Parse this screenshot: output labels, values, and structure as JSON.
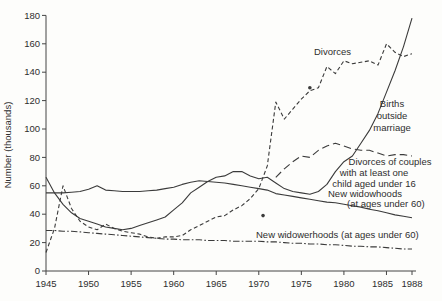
{
  "chart_data": {
    "type": "line",
    "title": "",
    "xlabel": "",
    "ylabel": "Number (thousands)",
    "xlim": [
      1945,
      1988
    ],
    "ylim": [
      0,
      180
    ],
    "grid": false,
    "legend_position": "inline-annotations",
    "x_ticks": [
      1945,
      1950,
      1955,
      1960,
      1965,
      1970,
      1975,
      1980,
      1985,
      1988
    ],
    "y_ticks": [
      0,
      20,
      40,
      60,
      80,
      100,
      120,
      140,
      160,
      180
    ],
    "x": [
      1945,
      1946,
      1947,
      1948,
      1949,
      1950,
      1951,
      1952,
      1953,
      1954,
      1955,
      1956,
      1957,
      1958,
      1959,
      1960,
      1961,
      1962,
      1963,
      1964,
      1965,
      1966,
      1967,
      1968,
      1969,
      1970,
      1971,
      1972,
      1973,
      1974,
      1975,
      1976,
      1977,
      1978,
      1979,
      1980,
      1981,
      1982,
      1983,
      1984,
      1985,
      1986,
      1987,
      1988
    ],
    "series": [
      {
        "name": "Divorces",
        "style": "short-dash",
        "values": [
          13,
          30,
          60,
          44,
          35,
          31,
          29,
          33,
          30,
          28,
          27,
          26,
          24,
          23,
          24,
          24,
          25,
          29,
          32,
          35,
          38,
          39,
          43,
          46,
          51,
          58,
          74,
          119,
          107,
          114,
          121,
          127,
          129,
          144,
          139,
          148,
          146,
          147,
          148,
          145,
          160,
          154,
          151,
          153
        ]
      },
      {
        "name": "Births outside marriage",
        "style": "solid",
        "values": [
          66,
          55,
          47,
          41,
          37,
          35,
          33,
          31,
          30,
          29,
          30,
          32,
          34,
          36,
          38,
          43,
          48,
          55,
          59,
          63,
          66,
          67,
          70,
          70,
          67,
          65,
          66,
          62,
          58,
          56,
          55,
          54,
          56,
          61,
          70,
          77,
          81,
          90,
          99,
          111,
          126,
          141,
          158,
          178
        ]
      },
      {
        "name": "Divorces of couples with at least one child aged under 16",
        "style": "long-dash",
        "values": [
          null,
          null,
          null,
          null,
          null,
          null,
          null,
          null,
          null,
          null,
          null,
          null,
          null,
          null,
          null,
          null,
          null,
          null,
          null,
          null,
          null,
          null,
          null,
          null,
          null,
          null,
          null,
          66,
          72,
          77,
          81,
          80,
          85,
          88,
          90,
          88,
          86,
          85,
          85,
          83,
          81,
          82,
          82,
          81
        ]
      },
      {
        "name": "New widowhoods (at ages under 60)",
        "style": "solid",
        "values": [
          55,
          55,
          55,
          55.5,
          56,
          57.5,
          60,
          57,
          56.5,
          56,
          56,
          56,
          56.5,
          57,
          58,
          59,
          61,
          62.5,
          63.5,
          63,
          62.5,
          62,
          61,
          60,
          59,
          58,
          57,
          54.5,
          53.5,
          52.5,
          51.5,
          50.5,
          49.5,
          48.5,
          48,
          47,
          46,
          45,
          43.5,
          42.5,
          41,
          39.5,
          38.5,
          37.5
        ]
      },
      {
        "name": "New widowerhoods (at ages under 60)",
        "style": "dash-dot",
        "values": [
          28.5,
          28.5,
          28,
          28,
          27.5,
          27,
          26.5,
          26,
          25.5,
          25,
          24.5,
          24,
          23.5,
          23,
          22.5,
          22.5,
          22,
          22,
          22,
          21.5,
          21.5,
          21.5,
          21,
          21,
          21,
          21,
          20.5,
          20.5,
          20,
          19.5,
          19.5,
          19,
          19,
          18.5,
          18.5,
          18,
          17.5,
          17.5,
          17,
          17,
          16.5,
          16,
          15.5,
          15.5
        ]
      }
    ],
    "point_markers": [
      {
        "x": 1970.5,
        "y": 39
      },
      {
        "x": 1976,
        "y": 129
      }
    ],
    "annotations": [
      {
        "text": "Divorces",
        "x": 314,
        "y": 55,
        "anchor": "start"
      },
      {
        "text": "Births",
        "x": 392,
        "y": 107,
        "anchor": "middle"
      },
      {
        "text": "outside",
        "x": 392,
        "y": 119,
        "anchor": "middle"
      },
      {
        "text": "marriage",
        "x": 392,
        "y": 131,
        "anchor": "middle"
      },
      {
        "text": "Divorces of couples",
        "x": 390,
        "y": 165,
        "anchor": "middle"
      },
      {
        "text": "with at least one",
        "x": 374,
        "y": 176,
        "anchor": "middle"
      },
      {
        "text": "child aged under 16",
        "x": 374,
        "y": 187,
        "anchor": "middle"
      },
      {
        "text": "New widowhoods",
        "x": 328,
        "y": 197,
        "anchor": "start"
      },
      {
        "text": "(at ages under 60)",
        "x": 347,
        "y": 207,
        "anchor": "start"
      },
      {
        "text": "New widowerhoods (at ages under 60)",
        "x": 256,
        "y": 238,
        "anchor": "start"
      }
    ],
    "line_color": "#3b3b3b",
    "axis_color": "#444444"
  }
}
